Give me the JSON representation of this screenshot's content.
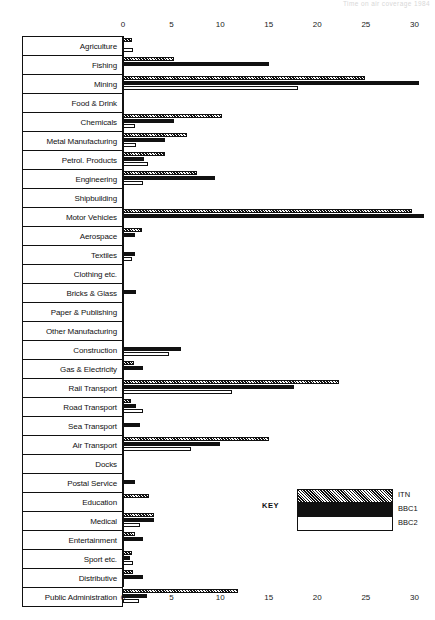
{
  "top_caption": "Time on air coverage 1984",
  "legend": {
    "key_label": "KEY",
    "entries": [
      {
        "name": "ITN",
        "pattern": "hatched"
      },
      {
        "name": "BBC1",
        "pattern": "solid-black"
      },
      {
        "name": "BBC2",
        "pattern": "white-outline"
      }
    ]
  },
  "chart_data": {
    "type": "bar",
    "orientation": "horizontal",
    "title": "",
    "subtitle": "",
    "xlabel": "",
    "ylabel": "",
    "xlim": [
      0,
      31.5
    ],
    "xticks": [
      0,
      5,
      10,
      15,
      20,
      25,
      30
    ],
    "grid": false,
    "legend_position": "inside-bottom-right",
    "series_order": [
      "ITN",
      "BBC1",
      "BBC2"
    ],
    "categories": [
      "Agriculture",
      "Fishing",
      "Mining",
      "Food & Drink",
      "Chemicals",
      "Metal Manufacturing",
      "Petrol. Products",
      "Engineering",
      "Shipbuilding",
      "Motor Vehicles",
      "Aerospace",
      "Textiles",
      "Clothing etc.",
      "Bricks & Glass",
      "Paper & Publishing",
      "Other Manufacturing",
      "Construction",
      "Gas & Electricity",
      "Rail Transport",
      "Road Transport",
      "Sea Transport",
      "Air Transport",
      "Docks",
      "Postal Service",
      "Education",
      "Medical",
      "Entertainment",
      "Sport etc.",
      "Distributive",
      "Public Administration"
    ],
    "series": [
      {
        "name": "ITN",
        "values": [
          0.9,
          5.2,
          24.9,
          0,
          10.2,
          6.6,
          4.3,
          7.6,
          0,
          29.8,
          2.0,
          0,
          0,
          0,
          0,
          0,
          0,
          1.1,
          22.2,
          0.8,
          0,
          15.0,
          0,
          0,
          2.7,
          3.2,
          1.2,
          0.9,
          1.0,
          11.8
        ]
      },
      {
        "name": "BBC1",
        "values": [
          0,
          15.0,
          30.5,
          0,
          5.3,
          4.3,
          2.2,
          9.5,
          0,
          31.0,
          1.2,
          1.2,
          0,
          1.3,
          0,
          0,
          6.0,
          2.1,
          17.6,
          1.3,
          1.8,
          10.0,
          0,
          1.2,
          0,
          3.2,
          2.1,
          0.7,
          2.1,
          2.5
        ]
      },
      {
        "name": "BBC2",
        "values": [
          1.0,
          0,
          18.0,
          0,
          1.2,
          1.3,
          2.6,
          2.1,
          0,
          0,
          0,
          0.9,
          0,
          0,
          0,
          0,
          4.7,
          0,
          11.2,
          2.1,
          0,
          7.0,
          0,
          0,
          0,
          1.7,
          0,
          1.0,
          0,
          1.6
        ]
      }
    ]
  }
}
